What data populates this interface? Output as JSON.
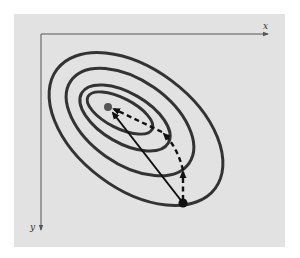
{
  "diagram": {
    "type": "contour-plot with optimization path",
    "axes": {
      "x_label": "x",
      "y_label": "y"
    },
    "contours": {
      "count": 4,
      "color": "#333333"
    },
    "points": {
      "optimum": {
        "name": "minimum",
        "color": "#555555"
      },
      "start": {
        "name": "start-point",
        "color": "#111111"
      }
    },
    "paths": [
      {
        "name": "direct-path",
        "style": "solid-arrow",
        "from": "start",
        "to": "optimum"
      },
      {
        "name": "stepwise-path",
        "style": "dashed-arrows",
        "from": "start",
        "to": "optimum"
      }
    ],
    "colors": {
      "panel": "#e2e2e2",
      "axis": "#555555",
      "contour": "#333333",
      "arrow": "#111111"
    }
  }
}
